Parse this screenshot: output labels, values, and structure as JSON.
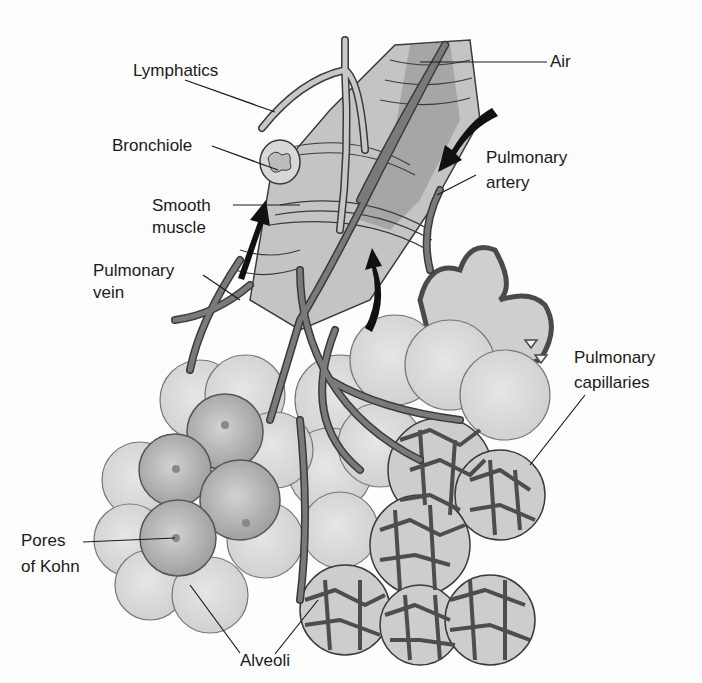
{
  "diagram": {
    "colors": {
      "background": "#fdfdfd",
      "vessel": "#6e6e6e",
      "vessel_outline": "#3a3a3a",
      "bronchiole": "#c9c9c9",
      "alveolus_light": "#d6d6d6",
      "alveolus_dark": "#a9a9a9",
      "capillary": "#4d4d4d",
      "arrow": "#111111",
      "text": "#1a1a1a"
    },
    "labels": {
      "lymphatics": "Lymphatics",
      "air": "Air",
      "bronchiole": "Bronchiole",
      "pulmonary_artery_1": "Pulmonary",
      "pulmonary_artery_2": "artery",
      "smooth_muscle_1": "Smooth",
      "smooth_muscle_2": "muscle",
      "pulmonary_vein_1": "Pulmonary",
      "pulmonary_vein_2": "vein",
      "pulmonary_capillaries_1": "Pulmonary",
      "pulmonary_capillaries_2": "capillaries",
      "pores_of_kohn_1": "Pores",
      "pores_of_kohn_2": "of Kohn",
      "alveoli": "Alveoli"
    },
    "flow_arrows": [
      {
        "name": "artery-flow",
        "direction": "down-left"
      },
      {
        "name": "vein-flow",
        "direction": "up"
      },
      {
        "name": "alveolar-return-flow",
        "direction": "up"
      }
    ]
  }
}
